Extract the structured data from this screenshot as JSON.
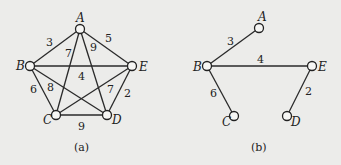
{
  "figures": [
    {
      "id": "a",
      "caption": "(a)",
      "description": "Complete weighted graph on 5 vertices",
      "nodes": [
        {
          "id": "A",
          "label": "A"
        },
        {
          "id": "B",
          "label": "B"
        },
        {
          "id": "C",
          "label": "C"
        },
        {
          "id": "D",
          "label": "D"
        },
        {
          "id": "E",
          "label": "E"
        }
      ],
      "edges": [
        {
          "from": "A",
          "to": "B",
          "weight": "3"
        },
        {
          "from": "A",
          "to": "E",
          "weight": "5"
        },
        {
          "from": "A",
          "to": "C",
          "weight": "7"
        },
        {
          "from": "A",
          "to": "D",
          "weight": "9"
        },
        {
          "from": "B",
          "to": "E",
          "weight": "4"
        },
        {
          "from": "B",
          "to": "C",
          "weight": "6"
        },
        {
          "from": "B",
          "to": "D",
          "weight": "8"
        },
        {
          "from": "C",
          "to": "E",
          "weight": "7"
        },
        {
          "from": "E",
          "to": "D",
          "weight": "2"
        },
        {
          "from": "C",
          "to": "D",
          "weight": "9"
        }
      ]
    },
    {
      "id": "b",
      "caption": "(b)",
      "description": "Minimum spanning tree",
      "nodes": [
        {
          "id": "A",
          "label": "A"
        },
        {
          "id": "B",
          "label": "B"
        },
        {
          "id": "C",
          "label": "C"
        },
        {
          "id": "D",
          "label": "D"
        },
        {
          "id": "E",
          "label": "E"
        }
      ],
      "edges": [
        {
          "from": "A",
          "to": "B",
          "weight": "3"
        },
        {
          "from": "B",
          "to": "E",
          "weight": "4"
        },
        {
          "from": "B",
          "to": "C",
          "weight": "6"
        },
        {
          "from": "E",
          "to": "D",
          "weight": "2"
        }
      ]
    }
  ]
}
